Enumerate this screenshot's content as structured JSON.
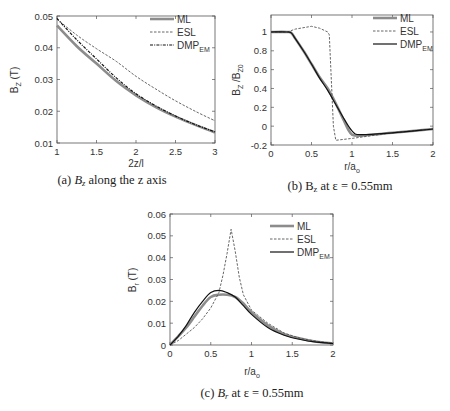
{
  "chart_data": [
    {
      "type": "line",
      "title": "",
      "caption": "(a) B_z along the z axis",
      "caption_parts": {
        "prefix": "(a) ",
        "var": "B",
        "sub": "z",
        "suffix": " along the z axis"
      },
      "xlabel": "2z/l",
      "ylabel": "B_Z (T)",
      "xlim": [
        1,
        3
      ],
      "ylim": [
        0.01,
        0.05
      ],
      "xticks": [
        "1",
        "1.5",
        "2",
        "2.5",
        "3"
      ],
      "yticks": [
        "0.01",
        "0.02",
        "0.03",
        "0.04",
        "0.05"
      ],
      "legend": [
        "ML",
        "ESL",
        "DMP_EM"
      ],
      "legend_position": "upper right",
      "x": [
        1.0,
        1.25,
        1.5,
        1.75,
        2.0,
        2.25,
        2.5,
        2.75,
        3.0
      ],
      "series": [
        {
          "name": "ML",
          "values": [
            0.047,
            0.0405,
            0.035,
            0.0295,
            0.025,
            0.0213,
            0.0183,
            0.0157,
            0.0133
          ]
        },
        {
          "name": "ESL",
          "values": [
            0.049,
            0.044,
            0.0397,
            0.0357,
            0.031,
            0.027,
            0.0233,
            0.02,
            0.017
          ]
        },
        {
          "name": "DMP_EM",
          "values": [
            0.0492,
            0.0425,
            0.0365,
            0.0305,
            0.0255,
            0.0217,
            0.0185,
            0.0158,
            0.0135
          ]
        }
      ]
    },
    {
      "type": "line",
      "title": "",
      "caption": "(b) B_z at ε = 0.55mm",
      "caption_parts": {
        "prefix": "(b) B",
        "sub": "z",
        "suffix": "  at ε = 0.55mm"
      },
      "xlabel": "r/a_o",
      "ylabel": "B_Z /B_Z0",
      "xlim": [
        0,
        2
      ],
      "ylim": [
        -0.2,
        1.18
      ],
      "xticks": [
        "0",
        "0.5",
        "1",
        "1.5",
        "2"
      ],
      "yticks": [
        "-0.2",
        "0",
        "0.2",
        "0.4",
        "0.6",
        "0.8",
        "1"
      ],
      "legend": [
        "ML",
        "ESL",
        "DMP_EM"
      ],
      "legend_position": "upper right",
      "series": [
        {
          "name": "ML",
          "x": [
            0,
            0.2,
            0.25,
            0.3,
            0.4,
            0.5,
            0.6,
            0.7,
            0.8,
            0.9,
            0.95,
            1.0,
            1.1,
            1.5,
            2.0
          ],
          "values": [
            1.0,
            1.0,
            0.99,
            0.93,
            0.8,
            0.66,
            0.52,
            0.4,
            0.24,
            0.06,
            -0.03,
            -0.09,
            -0.1,
            -0.07,
            -0.03
          ]
        },
        {
          "name": "ESL",
          "x": [
            0,
            0.2,
            0.3,
            0.5,
            0.6,
            0.7,
            0.72,
            0.77,
            0.8,
            1.0,
            1.5,
            2.0
          ],
          "values": [
            1.0,
            1.0,
            1.03,
            1.06,
            1.04,
            1.0,
            0.97,
            0.0,
            -0.15,
            -0.13,
            -0.07,
            -0.03
          ]
        },
        {
          "name": "DMP_EM",
          "x": [
            0,
            0.2,
            0.25,
            0.3,
            0.4,
            0.5,
            0.6,
            0.7,
            0.8,
            0.9,
            1.0,
            1.1,
            1.5,
            2.0
          ],
          "values": [
            1.0,
            1.0,
            0.99,
            0.93,
            0.8,
            0.66,
            0.51,
            0.38,
            0.23,
            0.08,
            -0.05,
            -0.09,
            -0.07,
            -0.03
          ]
        }
      ]
    },
    {
      "type": "line",
      "title": "",
      "caption": "(c) B_r at ε = 0.55mm",
      "caption_parts": {
        "prefix": "(c) ",
        "var": "B",
        "sub": "r",
        "suffix": " at ε = 0.55mm"
      },
      "xlabel": "r/a_o",
      "ylabel": "B_r (T)",
      "xlim": [
        0,
        2
      ],
      "ylim": [
        0,
        0.06
      ],
      "xticks": [
        "0",
        "0.5",
        "1",
        "1.5",
        "2"
      ],
      "yticks": [
        "0",
        "0.01",
        "0.02",
        "0.03",
        "0.04",
        "0.05",
        "0.06"
      ],
      "legend": [
        "ML",
        "ESL",
        "DMP_EM"
      ],
      "legend_position": "upper right",
      "series": [
        {
          "name": "ML",
          "x": [
            0,
            0.1,
            0.2,
            0.3,
            0.4,
            0.5,
            0.6,
            0.7,
            0.8,
            0.9,
            1.0,
            1.2,
            1.4,
            1.6,
            1.8,
            2.0
          ],
          "values": [
            0,
            0.004,
            0.008,
            0.013,
            0.018,
            0.022,
            0.023,
            0.023,
            0.022,
            0.019,
            0.015,
            0.009,
            0.005,
            0.003,
            0.0015,
            0.0008
          ]
        },
        {
          "name": "ESL",
          "x": [
            0,
            0.1,
            0.2,
            0.3,
            0.4,
            0.5,
            0.6,
            0.65,
            0.7,
            0.75,
            0.8,
            0.85,
            0.9,
            1.0,
            1.2,
            1.4,
            1.6,
            1.8,
            2.0
          ],
          "values": [
            0,
            0.002,
            0.005,
            0.008,
            0.012,
            0.017,
            0.024,
            0.032,
            0.042,
            0.053,
            0.043,
            0.031,
            0.023,
            0.016,
            0.01,
            0.0055,
            0.003,
            0.0017,
            0.0008
          ]
        },
        {
          "name": "DMP_EM",
          "x": [
            0,
            0.1,
            0.2,
            0.3,
            0.4,
            0.5,
            0.6,
            0.7,
            0.8,
            0.9,
            1.0,
            1.2,
            1.4,
            1.6,
            1.8,
            2.0
          ],
          "values": [
            0,
            0.004,
            0.009,
            0.015,
            0.02,
            0.024,
            0.025,
            0.024,
            0.022,
            0.018,
            0.014,
            0.008,
            0.0045,
            0.0025,
            0.0013,
            0.0007
          ]
        }
      ]
    }
  ],
  "colors": {
    "ML": "#8c8c8c",
    "ESL": "#555555",
    "DMP_EM": "#111111",
    "axis": "#555555"
  }
}
